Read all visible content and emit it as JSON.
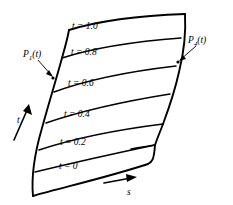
{
  "figure": {
    "background_color": "#ffffff",
    "line_color": "#000000"
  },
  "iso_curves": [
    {
      "label": "t = 1.0",
      "value": "1.0",
      "label_x": 72,
      "label_y": 22
    },
    {
      "label": "t = 0.8",
      "value": "0.8",
      "label_x": 71,
      "label_y": 48
    },
    {
      "label": "t = 0.6",
      "value": "0.6",
      "label_x": 68,
      "label_y": 79
    },
    {
      "label": "t = 0.4",
      "value": "0.4",
      "label_x": 64,
      "label_y": 110
    },
    {
      "label": "t = 0.2",
      "value": "0.2",
      "label_x": 60,
      "label_y": 138
    },
    {
      "label": "t = 0",
      "value": "0",
      "label_x": 59,
      "label_y": 162
    }
  ],
  "boundary_labels": [
    {
      "name": "P1",
      "base": "P",
      "subscript": "1",
      "suffix": "(t)",
      "x": 23,
      "y": 50
    },
    {
      "name": "P4",
      "base": "P",
      "subscript": "4",
      "suffix": "(t)",
      "x": 188,
      "y": 36
    }
  ],
  "axes": [
    {
      "name": "t-axis",
      "label": "t",
      "x": 17,
      "y": 116
    },
    {
      "name": "s-axis",
      "label": "s",
      "x": 127,
      "y": 188
    }
  ]
}
